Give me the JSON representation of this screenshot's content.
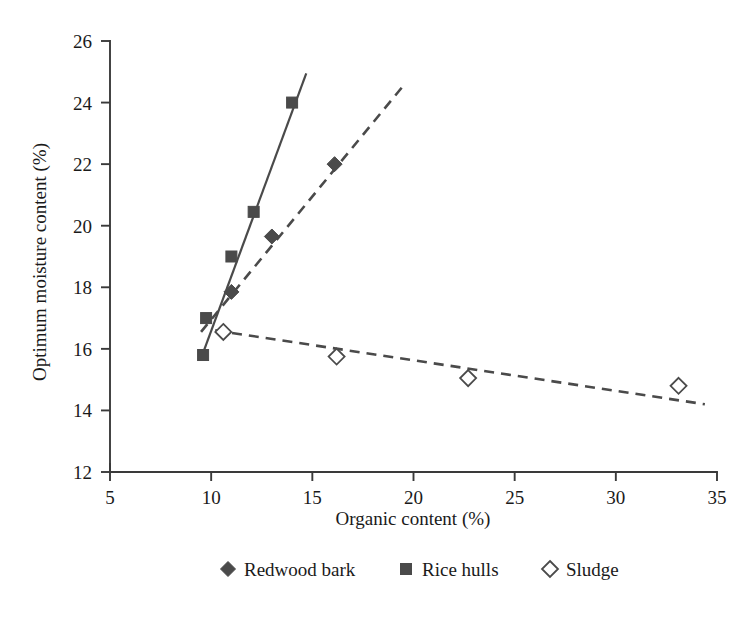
{
  "chart_data": {
    "type": "scatter",
    "title": "",
    "xlabel": "Organic content (%)",
    "ylabel": "Optimum moisture content (%)",
    "xlim": [
      5,
      35
    ],
    "ylim": [
      12,
      26
    ],
    "xticks": [
      5,
      10,
      15,
      20,
      25,
      30,
      35
    ],
    "yticks": [
      12,
      14,
      16,
      18,
      20,
      22,
      24,
      26
    ],
    "grid": false,
    "legend_position": "bottom",
    "series": [
      {
        "name": "Redwood bark",
        "marker": "filled-diamond",
        "linestyle": "dashed",
        "color": "#4a4a4a",
        "points": [
          {
            "x": 11.0,
            "y": 17.85
          },
          {
            "x": 13.0,
            "y": 19.65
          },
          {
            "x": 16.1,
            "y": 22.0
          }
        ],
        "trendline": [
          {
            "x": 9.5,
            "y": 16.55
          },
          {
            "x": 19.5,
            "y": 24.55
          }
        ]
      },
      {
        "name": "Rice hulls",
        "marker": "filled-square",
        "linestyle": "solid",
        "color": "#4a4a4a",
        "points": [
          {
            "x": 9.6,
            "y": 15.8
          },
          {
            "x": 9.75,
            "y": 17.0
          },
          {
            "x": 11.0,
            "y": 19.0
          },
          {
            "x": 12.1,
            "y": 20.45
          },
          {
            "x": 14.0,
            "y": 24.0
          }
        ],
        "trendline": [
          {
            "x": 9.55,
            "y": 15.78
          },
          {
            "x": 14.7,
            "y": 24.95
          }
        ]
      },
      {
        "name": "Sludge",
        "marker": "open-diamond",
        "linestyle": "dashed",
        "color": "#4a4a4a",
        "points": [
          {
            "x": 10.6,
            "y": 16.55
          },
          {
            "x": 16.2,
            "y": 15.75
          },
          {
            "x": 22.7,
            "y": 15.05
          },
          {
            "x": 33.1,
            "y": 14.8
          }
        ],
        "trendline": [
          {
            "x": 10.2,
            "y": 16.6
          },
          {
            "x": 34.4,
            "y": 14.2
          }
        ]
      }
    ]
  },
  "axes": {
    "x_tick_labels": [
      "5",
      "10",
      "15",
      "20",
      "25",
      "30",
      "35"
    ],
    "y_tick_labels": [
      "12",
      "14",
      "16",
      "18",
      "20",
      "22",
      "24",
      "26"
    ],
    "x_title": "Organic content (%)",
    "y_title": "Optimum moisture content (%)"
  },
  "legend": {
    "items": [
      {
        "label": "Redwood bark",
        "marker": "filled-diamond"
      },
      {
        "label": "Rice hulls",
        "marker": "filled-square"
      },
      {
        "label": "Sludge",
        "marker": "open-diamond"
      }
    ]
  },
  "colors": {
    "line": "#4a4a4a",
    "axis": "#3a3a3a",
    "text": "#1a1a1a",
    "background": "#ffffff"
  }
}
